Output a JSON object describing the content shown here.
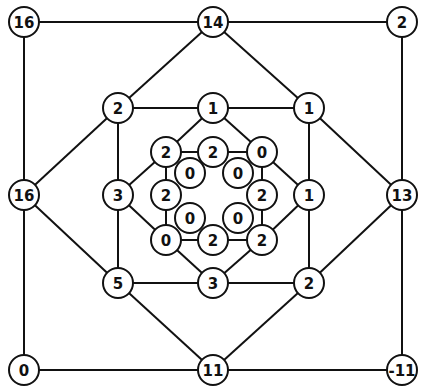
{
  "diagram": {
    "type": "graph",
    "colors": {
      "line": "#111111",
      "node_fill": "#ffffff",
      "text": "#111111"
    },
    "nodes": [
      {
        "id": "o_tl",
        "label": "16",
        "x": 24,
        "y": 22,
        "r": 15
      },
      {
        "id": "o_tm",
        "label": "14",
        "x": 213,
        "y": 22,
        "r": 15
      },
      {
        "id": "o_tr",
        "label": "2",
        "x": 402,
        "y": 22,
        "r": 15
      },
      {
        "id": "o_ml",
        "label": "16",
        "x": 24,
        "y": 195,
        "r": 15
      },
      {
        "id": "o_mr",
        "label": "13",
        "x": 402,
        "y": 195,
        "r": 15
      },
      {
        "id": "o_bl",
        "label": "0",
        "x": 24,
        "y": 370,
        "r": 15
      },
      {
        "id": "o_bm",
        "label": "11",
        "x": 213,
        "y": 370,
        "r": 15
      },
      {
        "id": "o_br",
        "label": "-11",
        "x": 402,
        "y": 370,
        "r": 15
      },
      {
        "id": "m_tl",
        "label": "2",
        "x": 118,
        "y": 108,
        "r": 15
      },
      {
        "id": "m_tm",
        "label": "1",
        "x": 213,
        "y": 108,
        "r": 15
      },
      {
        "id": "m_tr",
        "label": "1",
        "x": 309,
        "y": 108,
        "r": 15
      },
      {
        "id": "m_ml",
        "label": "3",
        "x": 118,
        "y": 195,
        "r": 15
      },
      {
        "id": "m_mr",
        "label": "1",
        "x": 309,
        "y": 195,
        "r": 15
      },
      {
        "id": "m_bl",
        "label": "5",
        "x": 118,
        "y": 283,
        "r": 15
      },
      {
        "id": "m_bm",
        "label": "3",
        "x": 213,
        "y": 283,
        "r": 15
      },
      {
        "id": "m_br",
        "label": "2",
        "x": 309,
        "y": 283,
        "r": 15
      },
      {
        "id": "i_tl",
        "label": "2",
        "x": 166,
        "y": 152,
        "r": 15
      },
      {
        "id": "i_tm",
        "label": "2",
        "x": 213,
        "y": 152,
        "r": 15
      },
      {
        "id": "i_tr",
        "label": "0",
        "x": 262,
        "y": 152,
        "r": 15
      },
      {
        "id": "i_ml",
        "label": "2",
        "x": 166,
        "y": 195,
        "r": 15
      },
      {
        "id": "i_mr",
        "label": "2",
        "x": 262,
        "y": 195,
        "r": 15
      },
      {
        "id": "i_bl",
        "label": "0",
        "x": 166,
        "y": 240,
        "r": 15
      },
      {
        "id": "i_bm",
        "label": "2",
        "x": 213,
        "y": 240,
        "r": 15
      },
      {
        "id": "i_br",
        "label": "2",
        "x": 262,
        "y": 240,
        "r": 15
      },
      {
        "id": "c_tl",
        "label": "0",
        "x": 190,
        "y": 173,
        "r": 15
      },
      {
        "id": "c_tr",
        "label": "0",
        "x": 238,
        "y": 173,
        "r": 15
      },
      {
        "id": "c_bl",
        "label": "0",
        "x": 190,
        "y": 218,
        "r": 15
      },
      {
        "id": "c_br",
        "label": "0",
        "x": 238,
        "y": 218,
        "r": 15
      }
    ],
    "edges": [
      [
        "o_tl",
        "o_tm"
      ],
      [
        "o_tm",
        "o_tr"
      ],
      [
        "o_tr",
        "o_mr"
      ],
      [
        "o_mr",
        "o_br"
      ],
      [
        "o_br",
        "o_bm"
      ],
      [
        "o_bm",
        "o_bl"
      ],
      [
        "o_bl",
        "o_ml"
      ],
      [
        "o_ml",
        "o_tl"
      ],
      [
        "o_tm",
        "m_tl"
      ],
      [
        "m_tl",
        "o_ml"
      ],
      [
        "o_ml",
        "m_bl"
      ],
      [
        "m_bl",
        "o_bm"
      ],
      [
        "o_bm",
        "m_br"
      ],
      [
        "m_br",
        "o_mr"
      ],
      [
        "o_mr",
        "m_tr"
      ],
      [
        "m_tr",
        "o_tm"
      ],
      [
        "m_tl",
        "m_tm"
      ],
      [
        "m_tm",
        "m_tr"
      ],
      [
        "m_tr",
        "m_mr"
      ],
      [
        "m_mr",
        "m_br"
      ],
      [
        "m_br",
        "m_bm"
      ],
      [
        "m_bm",
        "m_bl"
      ],
      [
        "m_bl",
        "m_ml"
      ],
      [
        "m_ml",
        "m_tl"
      ],
      [
        "m_tm",
        "i_tl"
      ],
      [
        "i_tl",
        "m_ml"
      ],
      [
        "m_ml",
        "i_bl"
      ],
      [
        "i_bl",
        "m_bm"
      ],
      [
        "m_bm",
        "i_br"
      ],
      [
        "i_br",
        "m_mr"
      ],
      [
        "m_mr",
        "i_tr"
      ],
      [
        "i_tr",
        "m_tm"
      ],
      [
        "i_tl",
        "i_tm"
      ],
      [
        "i_tm",
        "i_tr"
      ],
      [
        "i_tr",
        "i_mr"
      ],
      [
        "i_mr",
        "i_br"
      ],
      [
        "i_br",
        "i_bm"
      ],
      [
        "i_bm",
        "i_bl"
      ],
      [
        "i_bl",
        "i_ml"
      ],
      [
        "i_ml",
        "i_tl"
      ]
    ]
  }
}
